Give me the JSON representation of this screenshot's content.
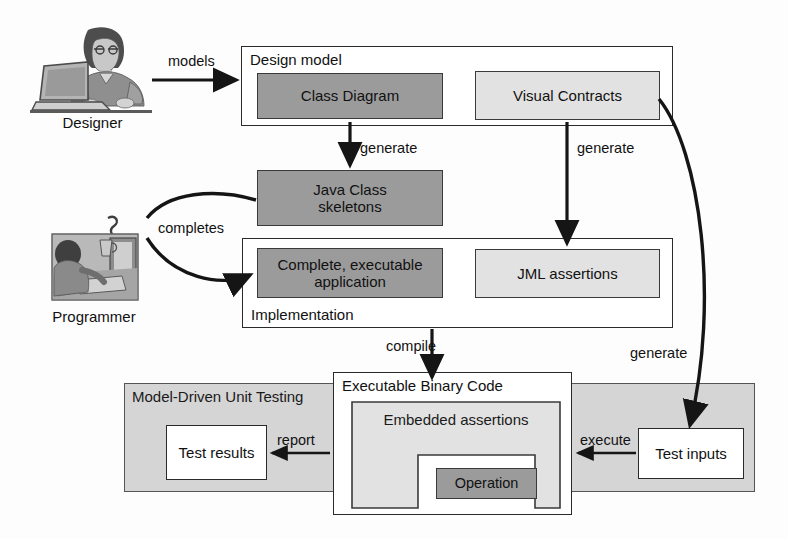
{
  "diagram": {
    "colors": {
      "dark_fill": "#9b9b9b",
      "light_fill": "#e2e2e2",
      "shaded_region": "#d5d5d5",
      "white_fill": "#ffffff",
      "stroke": "#2a2a2a",
      "text": "#111111"
    }
  },
  "actors": [
    {
      "id": "designer",
      "label": "Designer",
      "icon": "person-at-laptop-icon"
    },
    {
      "id": "programmer",
      "label": "Programmer",
      "icon": "person-at-desktop-icon"
    }
  ],
  "containers": {
    "design_model": {
      "title": "Design model",
      "title_position": "top-left"
    },
    "implementation": {
      "title": "Implementation",
      "title_position": "bottom-left"
    },
    "mdut": {
      "title": "Model-Driven Unit Testing",
      "title_position": "top-left"
    },
    "executable_binary": {
      "title": "Executable Binary Code",
      "title_position": "top-left"
    }
  },
  "nodes": {
    "class_diagram": {
      "label": "Class Diagram",
      "fill": "dark"
    },
    "visual_contracts": {
      "label": "Visual Contracts",
      "fill": "light"
    },
    "java_class_skeletons": {
      "label": "Java Class\nskeletons",
      "line1": "Java Class",
      "line2": "skeletons",
      "fill": "dark"
    },
    "complete_app": {
      "label": "Complete, executable\napplication",
      "line1": "Complete, executable",
      "line2": "application",
      "fill": "dark"
    },
    "jml_assertions": {
      "label": "JML assertions",
      "fill": "light"
    },
    "embedded_assertions": {
      "label": "Embedded assertions",
      "fill": "light"
    },
    "operation": {
      "label": "Operation",
      "fill": "dark"
    },
    "test_results": {
      "label": "Test results",
      "fill": "white"
    },
    "test_inputs": {
      "label": "Test inputs",
      "fill": "white"
    }
  },
  "edges": [
    {
      "id": "models",
      "label": "models",
      "from": "designer",
      "to": "design_model",
      "style": "straight-arrow"
    },
    {
      "id": "generate_skeletons",
      "label": "generate",
      "from": "class_diagram",
      "to": "java_class_skeletons",
      "style": "straight-arrow"
    },
    {
      "id": "generate_jml",
      "label": "generate",
      "from": "visual_contracts",
      "to": "jml_assertions",
      "style": "straight-arrow"
    },
    {
      "id": "completes_from_skeletons",
      "label": "completes",
      "from": "java_class_skeletons",
      "to": "programmer",
      "style": "curved-line"
    },
    {
      "id": "completes_to_app",
      "label": "completes",
      "from": "programmer",
      "to": "complete_app",
      "style": "curved-arrow"
    },
    {
      "id": "compile",
      "label": "compile",
      "from": "implementation",
      "to": "executable_binary",
      "style": "straight-arrow"
    },
    {
      "id": "generate_inputs",
      "label": "generate",
      "from": "visual_contracts",
      "to": "test_inputs",
      "style": "curved-arrow"
    },
    {
      "id": "execute",
      "label": "execute",
      "from": "test_inputs",
      "to": "executable_binary",
      "style": "straight-arrow"
    },
    {
      "id": "report",
      "label": "report",
      "from": "executable_binary",
      "to": "test_results",
      "style": "straight-arrow"
    }
  ]
}
